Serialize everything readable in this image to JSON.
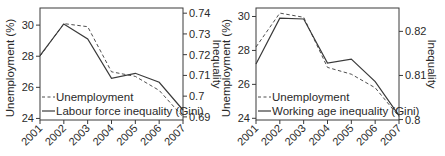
{
  "chart_data": [
    {
      "type": "line",
      "title": "",
      "x": [
        2001,
        2002,
        2003,
        2004,
        2005,
        2006,
        2007
      ],
      "categories": [
        "2001",
        "2002",
        "2003",
        "2004",
        "2005",
        "2006",
        "2007"
      ],
      "xlabel": "",
      "ylabel": "Unemployment (%)",
      "ylabel_right": "Inequality",
      "ylim": [
        23.9,
        31.1
      ],
      "ylim_right": [
        0.6885,
        0.7425
      ],
      "yticks": [
        24,
        26,
        28,
        30
      ],
      "yticks_right": [
        0.69,
        0.7,
        0.71,
        0.72,
        0.73,
        0.74
      ],
      "ytick_labels_right": [
        "0.69",
        "0.7",
        "0.71",
        "0.72",
        "0.73",
        "0.74"
      ],
      "grid": false,
      "legend_position": "lower left",
      "series": [
        {
          "name": "Unemployment",
          "axis": "left",
          "style": "dashed",
          "values": [
            28.0,
            30.1,
            29.9,
            27.0,
            26.7,
            25.8,
            24.1
          ]
        },
        {
          "name": "Labour force inequality (Gini)",
          "axis": "right",
          "style": "solid",
          "values": [
            0.7195,
            0.7348,
            0.7276,
            0.7086,
            0.711,
            0.7067,
            0.6933
          ]
        }
      ]
    },
    {
      "type": "line",
      "title": "",
      "x": [
        2001,
        2002,
        2003,
        2004,
        2005,
        2006,
        2007
      ],
      "categories": [
        "2001",
        "2002",
        "2003",
        "2004",
        "2005",
        "2006",
        "2007"
      ],
      "xlabel": "",
      "ylabel": "Unemployment (%)",
      "ylabel_right": "Inequality",
      "ylim": [
        23.9,
        30.5
      ],
      "ylim_right": [
        0.7999,
        0.8253
      ],
      "yticks": [
        24,
        26,
        28,
        30
      ],
      "yticks_right": [
        0.8,
        0.81,
        0.82
      ],
      "ytick_labels_right": [
        "0.8",
        "0.81",
        "0.82"
      ],
      "grid": false,
      "legend_position": "lower left",
      "series": [
        {
          "name": "Unemployment",
          "axis": "left",
          "style": "dashed",
          "values": [
            28.2,
            30.2,
            29.95,
            27.0,
            26.6,
            25.8,
            24.1
          ]
        },
        {
          "name": "Working age inequality (Gini)",
          "axis": "right",
          "style": "solid",
          "values": [
            0.8126,
            0.823,
            0.8228,
            0.8128,
            0.8137,
            0.8086,
            0.8009
          ]
        }
      ]
    }
  ],
  "colors": {
    "line": "#3a3a3a",
    "axis": "#3a3a3a",
    "text": "#2a2a2a",
    "background": "#ffffff"
  },
  "layout": {
    "panels": [
      {
        "box": {
          "left": 40,
          "top": 8,
          "right": 183,
          "bottom": 120
        },
        "ylabel_x": 14,
        "ylabel_right_x": 213,
        "legend_x": 42,
        "legend_y1": 101,
        "legend_y2": 115
      },
      {
        "box": {
          "left": 256,
          "top": 8,
          "right": 399,
          "bottom": 120
        },
        "ylabel_x": 230,
        "ylabel_right_x": 428,
        "legend_x": 258,
        "legend_y1": 101,
        "legend_y2": 115
      }
    ]
  }
}
